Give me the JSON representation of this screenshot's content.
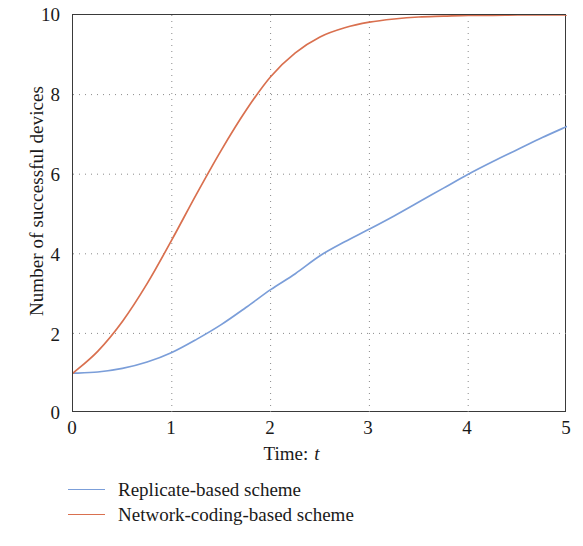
{
  "chart_data": {
    "type": "line",
    "title": "",
    "xlabel": "Time: t",
    "ylabel": "Number of successful devices",
    "xlim": [
      0,
      5
    ],
    "ylim": [
      0,
      10
    ],
    "xticks": [
      "0",
      "1",
      "2",
      "3",
      "4",
      "5"
    ],
    "yticks": [
      "0",
      "2",
      "4",
      "6",
      "8",
      "10"
    ],
    "grid": true,
    "grid_style": "dotted",
    "legend_position": "below-axes-left",
    "x": [
      0,
      0.25,
      0.5,
      0.75,
      1,
      1.25,
      1.5,
      1.75,
      2,
      2.25,
      2.5,
      2.75,
      3,
      3.25,
      3.5,
      3.75,
      4,
      4.25,
      4.5,
      4.75,
      5
    ],
    "series": [
      {
        "name": "Replicate-based scheme",
        "color": "#7b9ed9",
        "values": [
          1.0,
          1.03,
          1.12,
          1.28,
          1.52,
          1.85,
          2.22,
          2.65,
          3.1,
          3.5,
          3.95,
          4.3,
          4.62,
          4.95,
          5.3,
          5.65,
          6.0,
          6.32,
          6.62,
          6.92,
          7.2
        ]
      },
      {
        "name": "Network-coding-based scheme",
        "color": "#d9704f",
        "values": [
          1.0,
          1.55,
          2.3,
          3.25,
          4.35,
          5.5,
          6.6,
          7.6,
          8.45,
          9.05,
          9.45,
          9.68,
          9.82,
          9.9,
          9.95,
          9.97,
          9.99,
          9.99,
          10.0,
          10.0,
          10.0
        ]
      }
    ]
  },
  "legend": {
    "items": [
      {
        "label": "Replicate-based scheme",
        "color": "#7b9ed9"
      },
      {
        "label": "Network-coding-based scheme",
        "color": "#d9704f"
      }
    ]
  },
  "axes": {
    "y_title": "Number of successful devices",
    "x_title_prefix": "Time:",
    "x_title_var": "t"
  },
  "colors": {
    "series_blue": "#7b9ed9",
    "series_red": "#d9704f",
    "axis": "#3a3a3a",
    "grid": "#8a8a8a",
    "background": "#ffffff"
  }
}
